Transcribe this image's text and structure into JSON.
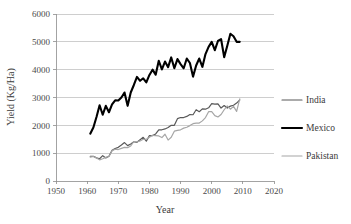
{
  "chart_data": {
    "type": "line",
    "title": "",
    "xlabel": "Year",
    "ylabel": "Yield (Kg/Ha)",
    "xlim": [
      1950,
      2020
    ],
    "ylim": [
      0,
      6000
    ],
    "xticks": [
      1950,
      1960,
      1970,
      1980,
      1990,
      2000,
      2010,
      2020
    ],
    "yticks": [
      0,
      1000,
      2000,
      3000,
      4000,
      5000,
      6000
    ],
    "grid": "horizontal",
    "legend_position": "right",
    "series": [
      {
        "name": "India",
        "color": "#595959",
        "width": 1.2,
        "x": [
          1961,
          1962,
          1963,
          1964,
          1965,
          1966,
          1967,
          1968,
          1969,
          1970,
          1971,
          1972,
          1973,
          1974,
          1975,
          1976,
          1977,
          1978,
          1979,
          1980,
          1981,
          1982,
          1983,
          1984,
          1985,
          1986,
          1987,
          1988,
          1989,
          1990,
          1991,
          1992,
          1993,
          1994,
          1995,
          1996,
          1997,
          1998,
          1999,
          2000,
          2001,
          2002,
          2003,
          2004,
          2005,
          2006,
          2007,
          2008,
          2009
        ],
        "values": [
          890,
          890,
          830,
          800,
          910,
          830,
          890,
          1100,
          1170,
          1210,
          1290,
          1380,
          1270,
          1330,
          1410,
          1390,
          1480,
          1570,
          1430,
          1630,
          1630,
          1690,
          1840,
          1840,
          1870,
          1920,
          2000,
          2000,
          2240,
          2280,
          2280,
          2320,
          2390,
          2380,
          2560,
          2490,
          2590,
          2580,
          2630,
          2780,
          2760,
          2770,
          2620,
          2710,
          2620,
          2690,
          2720,
          2800,
          2910
        ]
      },
      {
        "name": "Mexico",
        "color": "#000000",
        "width": 2.1,
        "x": [
          1961,
          1962,
          1963,
          1964,
          1965,
          1966,
          1967,
          1968,
          1969,
          1970,
          1971,
          1972,
          1973,
          1974,
          1975,
          1976,
          1977,
          1978,
          1979,
          1980,
          1981,
          1982,
          1983,
          1984,
          1985,
          1986,
          1987,
          1988,
          1989,
          1990,
          1991,
          1992,
          1993,
          1994,
          1995,
          1996,
          1997,
          1998,
          1999,
          2000,
          2001,
          2002,
          2003,
          2004,
          2005,
          2006,
          2007,
          2008,
          2009
        ],
        "values": [
          1700,
          1920,
          2300,
          2720,
          2380,
          2700,
          2470,
          2750,
          2900,
          2890,
          3000,
          3180,
          2700,
          3180,
          3450,
          3740,
          3600,
          3690,
          3540,
          3810,
          4000,
          3820,
          4320,
          4010,
          4290,
          4090,
          4440,
          4050,
          4380,
          4200,
          4050,
          4400,
          4240,
          3750,
          4150,
          4400,
          4100,
          4560,
          4820,
          5000,
          4700,
          5030,
          5100,
          4450,
          4860,
          5290,
          5200,
          5000,
          5000
        ]
      },
      {
        "name": "Pakistan",
        "color": "#a6a6a6",
        "width": 1.2,
        "x": [
          1961,
          1962,
          1963,
          1964,
          1965,
          1966,
          1967,
          1968,
          1969,
          1970,
          1971,
          1972,
          1973,
          1974,
          1975,
          1976,
          1977,
          1978,
          1979,
          1980,
          1981,
          1982,
          1983,
          1984,
          1985,
          1986,
          1987,
          1988,
          1989,
          1990,
          1991,
          1992,
          1993,
          1994,
          1995,
          1996,
          1997,
          1998,
          1999,
          2000,
          2001,
          2002,
          2003,
          2004,
          2005,
          2006,
          2007,
          2008,
          2009
        ],
        "values": [
          860,
          880,
          830,
          760,
          800,
          850,
          880,
          1090,
          1140,
          1130,
          1170,
          1210,
          1200,
          1260,
          1420,
          1400,
          1440,
          1500,
          1500,
          1570,
          1640,
          1630,
          1620,
          1560,
          1680,
          1470,
          1570,
          1790,
          1820,
          1840,
          1900,
          1930,
          1990,
          2060,
          2080,
          2080,
          2160,
          2280,
          2490,
          2490,
          2350,
          2300,
          2390,
          2560,
          2700,
          2580,
          2680,
          2500,
          2950
        ]
      }
    ]
  },
  "axes": {
    "y_tick_labels": [
      "0",
      "1000",
      "2000",
      "3000",
      "4000",
      "5000",
      "6000"
    ],
    "x_tick_labels": [
      "1950",
      "1960",
      "1970",
      "1980",
      "1990",
      "2000",
      "2010",
      "2020"
    ],
    "y_axis_title": "Yield (Kg/Ha)",
    "x_axis_title": "Year"
  },
  "legend": {
    "entries": [
      {
        "label": "India",
        "color": "#595959"
      },
      {
        "label": "Mexico",
        "color": "#000000"
      },
      {
        "label": "Pakistan",
        "color": "#a6a6a6"
      }
    ]
  }
}
